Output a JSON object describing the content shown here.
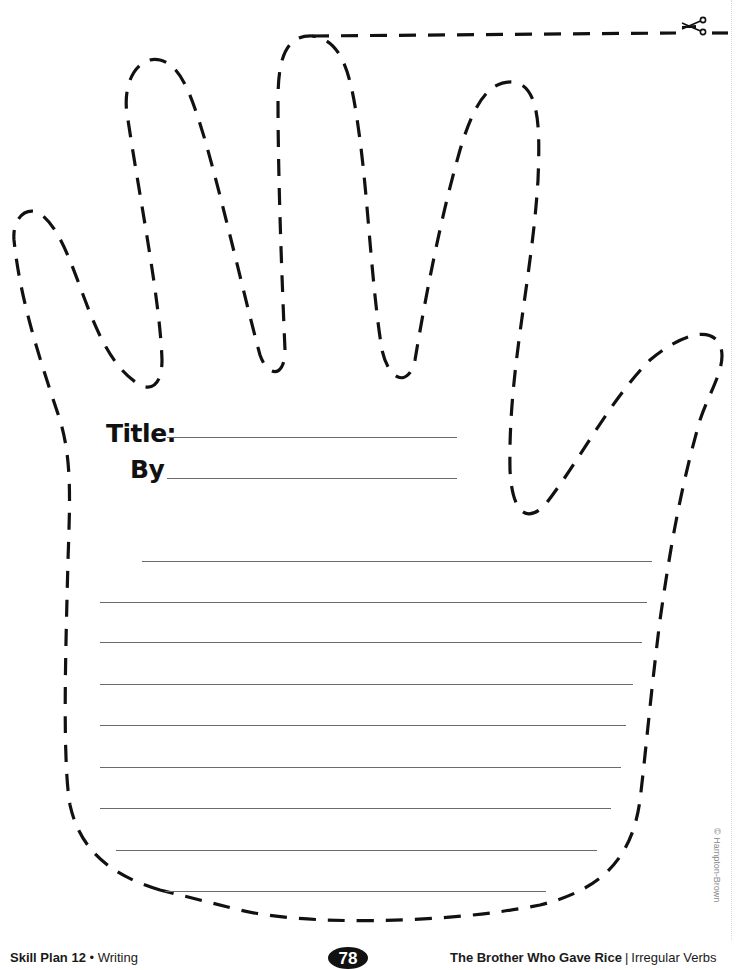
{
  "worksheet": {
    "form": {
      "title_label": "Title:",
      "by_label": "By"
    },
    "writing_lines_count": 9,
    "footer": {
      "left_bold": "Skill Plan 12",
      "left_separator": " • ",
      "left_text": "Writing",
      "page_number": "78",
      "right_bold": "The Brother Who Gave Rice",
      "right_separator": "|",
      "right_text": "Irregular Verbs"
    },
    "copyright": "© Hampton-Brown",
    "icons": {
      "cut_marker": "scissors-icon",
      "outline": "dashed-hand-outline"
    },
    "colors": {
      "outline": "#111111",
      "lines": "#6a6a6a",
      "page_badge": "#111111"
    }
  }
}
